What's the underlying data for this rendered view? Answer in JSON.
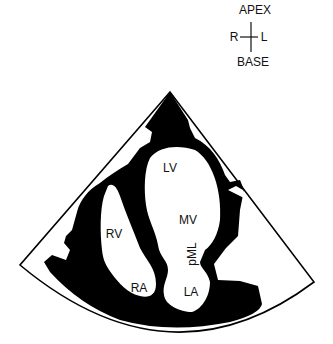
{
  "orientation": {
    "top": "APEX",
    "bottom": "BASE",
    "left": "R",
    "right": "L"
  },
  "diagram": {
    "colors": {
      "tissue": "#000000",
      "background": "#ffffff",
      "outline": "#000000"
    },
    "labels": {
      "lv": "LV",
      "rv": "RV",
      "mv": "MV",
      "pml": "pML",
      "ra": "RA",
      "la": "LA"
    }
  }
}
